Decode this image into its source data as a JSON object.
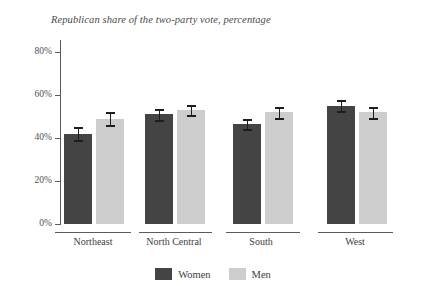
{
  "chart_data": {
    "type": "bar",
    "title": "Republican share of the two-party vote, percentage",
    "xlabel": "",
    "ylabel": "",
    "ylim": [
      0,
      85
    ],
    "grid": false,
    "legend_position": "bottom-center",
    "categories": [
      "Northeast",
      "North Central",
      "South",
      "West"
    ],
    "yticks": [
      "0%",
      "20%",
      "40%",
      "60%",
      "80%"
    ],
    "ytick_values": [
      0,
      20,
      40,
      60,
      80
    ],
    "series": [
      {
        "name": "Women",
        "color": "#444444",
        "values": [
          42,
          51,
          46.5,
          55
        ],
        "errors": [
          3.0,
          2.5,
          2.5,
          2.5
        ]
      },
      {
        "name": "Men",
        "color": "#cdcdcd",
        "values": [
          49,
          53,
          52,
          52
        ],
        "errors": [
          3.0,
          2.5,
          2.5,
          2.5
        ]
      }
    ]
  },
  "chart": {
    "title": "Republican share of the two-party vote, percentage",
    "ytick_labels": [
      "80%",
      "60%",
      "40%",
      "20%",
      "0%"
    ],
    "group_labels": [
      "Northeast",
      "North Central",
      "South",
      "West"
    ],
    "legend": [
      {
        "label": "Women",
        "color": "#444444"
      },
      {
        "label": "Men",
        "color": "#cdcdcd"
      }
    ]
  }
}
